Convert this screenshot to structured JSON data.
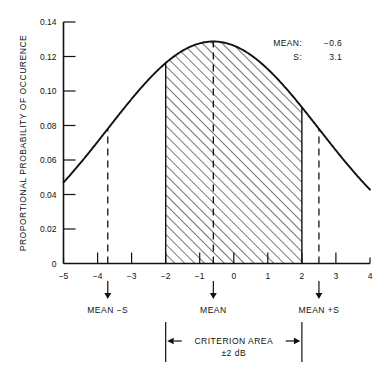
{
  "chart_data": {
    "type": "area",
    "title": "",
    "subtitle": "",
    "xlabel": "",
    "ylabel": "PROPORTIONAL PROBABILITY OF OCCURENCE",
    "xlim": [
      -5,
      4
    ],
    "ylim": [
      0,
      0.14
    ],
    "grid": false,
    "legend_position": "none",
    "distribution": "gaussian",
    "mean": -0.6,
    "sigma": 3.1,
    "peak_value": 0.1287,
    "x_ticks": [
      "-5",
      "-4",
      "-3",
      "-2",
      "-1",
      "0",
      "1",
      "2",
      "3",
      "4"
    ],
    "x_tick_values": [
      -5,
      -4,
      -3,
      -2,
      -1,
      0,
      1,
      2,
      3,
      4
    ],
    "y_ticks": [
      "0",
      "0.02",
      "0.04",
      "0.06",
      "0.08",
      "0.10",
      "0.12",
      "0.14"
    ],
    "y_tick_values": [
      0,
      0.02,
      0.04,
      0.06,
      0.08,
      0.1,
      0.12,
      0.14
    ],
    "x": [
      -5,
      -4.5,
      -4,
      -3.5,
      -3,
      -2.5,
      -2,
      -1.5,
      -1,
      -0.6,
      0,
      0.5,
      1,
      1.5,
      2,
      2.5,
      3,
      3.5,
      4
    ],
    "y": [
      0.0464,
      0.0575,
      0.0686,
      0.0793,
      0.0892,
      0.0981,
      0.1055,
      0.1144,
      0.1227,
      0.1287,
      0.1244,
      0.1182,
      0.1101,
      0.1004,
      0.0894,
      0.0777,
      0.0657,
      0.054,
      0.043
    ],
    "shaded_region": {
      "label": "CRITERION AREA",
      "from": -2,
      "to": 2,
      "fill": "diagonal-hatch"
    },
    "annotations": [
      {
        "name": "mean-minus-s",
        "label": "MEAN −S",
        "x": -3.7
      },
      {
        "name": "mean",
        "label": "MEAN",
        "x": -0.6
      },
      {
        "name": "mean-plus-s",
        "label": "MEAN +S",
        "x": 2.5
      }
    ]
  },
  "axes": {
    "y_title": "PROPORTIONAL PROBABILITY OF OCCURENCE",
    "y_tick_labels": [
      "0.14",
      "0.12",
      "0.10",
      "0.08",
      "0.06",
      "0.04",
      "0.02",
      "0"
    ],
    "x_tick_labels": [
      "−5",
      "−4",
      "−3",
      "−2",
      "−1",
      "0",
      "1",
      "2",
      "3",
      "4"
    ]
  },
  "stats_box": {
    "mean_label": "MEAN:",
    "mean_value": "−0.6",
    "s_label": "S:",
    "s_value": "3.1"
  },
  "markers": {
    "mean_minus_s": "MEAN −S",
    "mean": "MEAN",
    "mean_plus_s": "MEAN +S"
  },
  "criterion": {
    "title": "CRITERION AREA",
    "subtitle": "±2 dB"
  },
  "colors": {
    "ink": "#111111",
    "background": "#ffffff"
  }
}
